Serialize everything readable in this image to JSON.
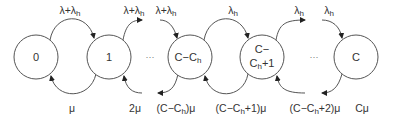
{
  "diagram": {
    "type": "state-transition (birth-death Markov chain)",
    "states": [
      {
        "id": "s0",
        "label": "0"
      },
      {
        "id": "s1",
        "label": "1"
      },
      {
        "id": "sCCh",
        "label": "C−C",
        "sub": "h"
      },
      {
        "id": "sCCh1",
        "line1": "C−",
        "line2": "C",
        "sub": "h",
        "line2_suffix": "+1"
      },
      {
        "id": "sC",
        "label": "C"
      }
    ],
    "ellipsis_1": "···",
    "ellipsis_2": "···",
    "forward_rates": [
      {
        "from": "0",
        "to": "1",
        "base": "λ+λ",
        "sub": "h"
      },
      {
        "from": "1",
        "to": "…",
        "base": "λ+λ",
        "sub": "h"
      },
      {
        "from": "…",
        "to": "C−Ch",
        "base": "λ+λ",
        "sub": "h"
      },
      {
        "from": "C−Ch",
        "to": "C−Ch+1",
        "base": "λ",
        "sub": "h"
      },
      {
        "from": "C−Ch+1",
        "to": "…",
        "base": "λ",
        "sub": "h"
      },
      {
        "from": "…",
        "to": "C",
        "base": "λ",
        "sub": "h"
      }
    ],
    "backward_rates": [
      {
        "label": "μ"
      },
      {
        "label": "2μ"
      },
      {
        "pre": "(C−C",
        "sub": "h",
        "post": ")μ"
      },
      {
        "pre": "(C−C",
        "sub": "h",
        "post": "+1)μ"
      },
      {
        "pre": "(C−C",
        "sub": "h",
        "post": "+2)μ"
      },
      {
        "label": "Cμ"
      }
    ]
  }
}
